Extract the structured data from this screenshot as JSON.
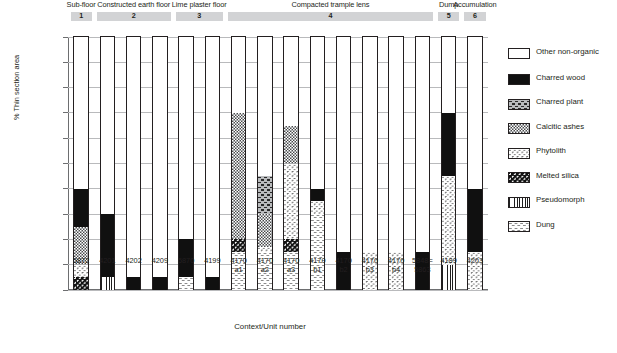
{
  "chart_data": {
    "type": "bar",
    "title": "",
    "xlabel": "Context/Unit number",
    "ylabel": "% Thin section area",
    "ylim": [
      0,
      100
    ],
    "ytick_labels": [
      "100%",
      "90%",
      "80%",
      "70%",
      "60%",
      "50%",
      "40%",
      "30%",
      "20%",
      "10%",
      "0%"
    ],
    "ytick_values": [
      100,
      90,
      80,
      70,
      60,
      50,
      40,
      30,
      20,
      10,
      0
    ],
    "grid": true,
    "stacked": true,
    "legend_position": "right",
    "legend": [
      "Other non-organic",
      "Charred wood",
      "Charred plant",
      "Calcitic ashes",
      "Phytolith",
      "Melted silica",
      "Pseudomorph",
      "Dung"
    ],
    "categories": [
      "5872",
      "4201",
      "4202",
      "4209",
      "5870",
      "4199",
      "4170\na1",
      "4170\na2",
      "4170\na3",
      "4170\nb1",
      "4170\nb2",
      "4170\nb3",
      "4170\nb4",
      "5848=\n5863",
      "4189",
      "4203"
    ],
    "series": [
      {
        "name": "Dung",
        "values": [
          0,
          0,
          0,
          0,
          5,
          0,
          15,
          15,
          15,
          30,
          0,
          0,
          0,
          0,
          0,
          0
        ]
      },
      {
        "name": "Pseudomorph",
        "values": [
          0,
          5,
          0,
          0,
          0,
          0,
          0,
          0,
          0,
          0,
          0,
          0,
          0,
          0,
          10,
          0
        ]
      },
      {
        "name": "Melted silica",
        "values": [
          5,
          0,
          0,
          0,
          0,
          0,
          5,
          0,
          5,
          0,
          0,
          0,
          0,
          0,
          0,
          0
        ]
      },
      {
        "name": "Phytolith",
        "values": [
          5,
          0,
          0,
          0,
          0,
          0,
          0,
          2,
          30,
          5,
          0,
          15,
          15,
          0,
          35,
          15
        ]
      },
      {
        "name": "Calcitic ashes",
        "values": [
          15,
          0,
          0,
          0,
          0,
          0,
          50,
          13,
          15,
          0,
          0,
          0,
          0,
          0,
          0,
          0
        ]
      },
      {
        "name": "Charred plant",
        "values": [
          0,
          0,
          0,
          0,
          0,
          0,
          0,
          15,
          0,
          0,
          0,
          0,
          0,
          0,
          0,
          0
        ]
      },
      {
        "name": "Charred wood",
        "values": [
          15,
          25,
          5,
          5,
          15,
          5,
          0,
          0,
          0,
          5,
          15,
          0,
          0,
          15,
          25,
          25
        ]
      },
      {
        "name": "Other non-organic",
        "values": [
          60,
          70,
          95,
          95,
          80,
          95,
          30,
          55,
          35,
          60,
          85,
          85,
          85,
          85,
          30,
          60
        ]
      }
    ],
    "groups": [
      {
        "label": "Sub-floor",
        "number": "1",
        "start_index": 0,
        "span": 1
      },
      {
        "label": "Constructed earth floor",
        "number": "2",
        "start_index": 1,
        "span": 3
      },
      {
        "label": "Lime plaster floor",
        "number": "3",
        "start_index": 4,
        "span": 2
      },
      {
        "label": "Compacted trample lens",
        "number": "4",
        "start_index": 6,
        "span": 8
      },
      {
        "label": "Dump",
        "number": "5",
        "start_index": 14,
        "span": 1
      },
      {
        "label": "Accumulation",
        "number": "6",
        "start_index": 15,
        "span": 1
      }
    ],
    "colors": {
      "group_band": "#d2d3d5",
      "axis": "#6d6e70",
      "grid": "#b9babc",
      "text": "#231f20",
      "charred_wood": "#101010",
      "calcitic_ashes": "#a9abad",
      "charred_plant": "#b9bbbd",
      "other_non_organic": "#ffffff"
    }
  }
}
